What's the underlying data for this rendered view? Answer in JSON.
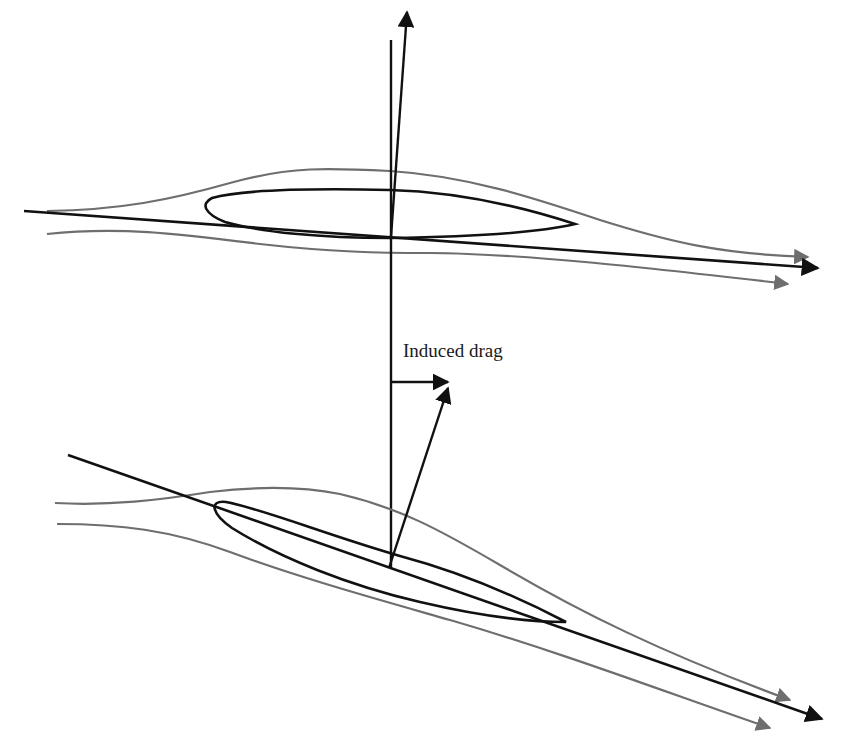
{
  "diagram": {
    "labels": {
      "induced_drag": "Induced drag"
    },
    "colors": {
      "ink": "#111111",
      "streamline": "#6e6e6e",
      "background": "#ffffff"
    },
    "panels": [
      {
        "id": "top",
        "description": "Airfoil at zero angle with vertical lift vector slightly tilted"
      },
      {
        "id": "bottom",
        "description": "Airfoil at angle of attack with tilted resultant; horizontal component labeled induced drag"
      }
    ]
  }
}
